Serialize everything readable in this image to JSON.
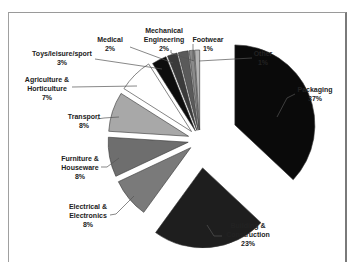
{
  "chart_data": {
    "type": "pie",
    "title": "",
    "exploded": true,
    "start_angle_deg": 0,
    "direction": "clockwise",
    "categories": [
      "Packaging",
      "Building & Construction",
      "Electrical & Electronics",
      "Furniture & Houseware",
      "Transport",
      "Agriculture & Horticulture",
      "Toys/leisure/sport",
      "Medical",
      "Mechanical Engineering",
      "Footwear",
      "Other"
    ],
    "values": [
      37,
      23,
      8,
      8,
      8,
      7,
      3,
      2,
      2,
      1,
      1
    ],
    "labels": [
      "37%",
      "23%",
      "8%",
      "8%",
      "8%",
      "7%",
      "3%",
      "2%",
      "2%",
      "1%",
      "1%"
    ],
    "colors": [
      "#0a0a0a",
      "#1e1e1e",
      "#7a7a7a",
      "#6e6e6e",
      "#a8a8a8",
      "#ffffff",
      "#0d0d0d",
      "#3a3a3a",
      "#5a5a5a",
      "#8a8a8a",
      "#b4b4b4"
    ],
    "legend": "none (data labels with leader lines)"
  },
  "labels": {
    "packaging": {
      "name": "Packaging",
      "pct": "37%"
    },
    "building": {
      "name1": "Building &",
      "name2": "Construction",
      "pct": "23%"
    },
    "electrical": {
      "name1": "Electrical &",
      "name2": "Electronics",
      "pct": "8%"
    },
    "furniture": {
      "name1": "Furniture &",
      "name2": "Houseware",
      "pct": "8%"
    },
    "transport": {
      "name": "Transport",
      "pct": "8%"
    },
    "agriculture": {
      "name1": "Agriculture &",
      "name2": "Horticulture",
      "pct": "7%"
    },
    "toys": {
      "name": "Toys/leisure/sport",
      "pct": "3%"
    },
    "medical": {
      "name": "Medical",
      "pct": "2%"
    },
    "mechanical": {
      "name1": "Mechanical",
      "name2": "Engineering",
      "pct": "2%"
    },
    "footwear": {
      "name": "Footwear",
      "pct": "1%"
    },
    "other": {
      "name": "Other",
      "pct": "1%"
    }
  }
}
